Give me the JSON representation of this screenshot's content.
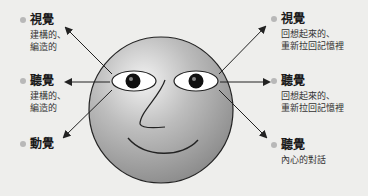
{
  "left": {
    "visual": {
      "title": "視覺",
      "desc": [
        "建構的、",
        "編造的"
      ]
    },
    "auditory": {
      "title": "聽覺",
      "desc": [
        "建構的、",
        "編造的"
      ]
    },
    "kinesthetic": {
      "title": "動覺"
    }
  },
  "right": {
    "visual": {
      "title": "視覺",
      "desc": [
        "回想起來的、",
        "重新拉回記憶裡"
      ]
    },
    "auditory": {
      "title": "聽覺",
      "desc": [
        "回想起來的、",
        "重新拉回記憶裡"
      ]
    },
    "internal": {
      "title": "聽覺",
      "desc": [
        "內心的對話"
      ]
    }
  },
  "colors": {
    "background": "#eeeeec",
    "bullet": "#b8b8b8",
    "face": "#a8a8a8",
    "outline": "#222222"
  }
}
